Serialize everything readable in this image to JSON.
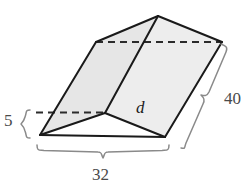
{
  "figure": {
    "kind": "geometric-solid",
    "colors": {
      "face_fill": "#e6e6e6",
      "face_fill_light": "#ededed",
      "edge_stroke": "#1a1a1a",
      "hidden_edge_stroke": "#2b2b2b",
      "brace_stroke": "#8a8a8a",
      "label_color": "#4a4a4a",
      "variable_color": "#1a1a1a",
      "background": "#ffffff"
    },
    "vertices": {
      "apex_top": [
        158,
        16
      ],
      "top_left": [
        96,
        42
      ],
      "top_right": [
        222,
        42
      ],
      "mid_front": [
        105,
        113
      ],
      "bottom_left": [
        40,
        135
      ],
      "bottom_right": [
        165,
        137
      ],
      "hidden_left": [
        40,
        113
      ]
    },
    "faces": [
      {
        "name": "left-slanted-face",
        "points": "96,42 158,16 105,113 40,135",
        "fill": "#e6e6e6"
      },
      {
        "name": "right-slanted-face",
        "points": "158,16 222,42 165,137 105,113",
        "fill": "#ededed"
      },
      {
        "name": "bottom-front-triangle",
        "points": "40,135 105,113 165,137",
        "fill": "#ffffff"
      }
    ],
    "solid_edges": [
      {
        "name": "edge-apex-to-topleft",
        "from": [
          158,
          16
        ],
        "to": [
          96,
          42
        ]
      },
      {
        "name": "edge-apex-to-topright",
        "from": [
          158,
          16
        ],
        "to": [
          222,
          42
        ]
      },
      {
        "name": "edge-apex-to-midfront",
        "from": [
          158,
          16
        ],
        "to": [
          105,
          113
        ]
      },
      {
        "name": "edge-topleft-to-bottomleft",
        "from": [
          96,
          42
        ],
        "to": [
          40,
          135
        ]
      },
      {
        "name": "edge-topright-to-bottomright",
        "from": [
          222,
          42
        ],
        "to": [
          165,
          137
        ]
      },
      {
        "name": "edge-bottomleft-to-midfront",
        "from": [
          40,
          135
        ],
        "to": [
          105,
          113
        ]
      },
      {
        "name": "edge-midfront-to-bottomright",
        "from": [
          105,
          113
        ],
        "to": [
          165,
          137
        ]
      },
      {
        "name": "edge-bottomleft-to-bottomright",
        "from": [
          40,
          135
        ],
        "to": [
          165,
          137
        ]
      }
    ],
    "hidden_edges": [
      {
        "name": "hidden-edge-top-back",
        "from": [
          96,
          42
        ],
        "to": [
          222,
          42
        ]
      },
      {
        "name": "hidden-edge-left-base",
        "from": [
          36,
          113
        ],
        "to": [
          105,
          113
        ]
      }
    ],
    "diagonal": {
      "name": "diagonal-d",
      "label": "d",
      "label_position": [
        136,
        99
      ]
    }
  },
  "dimensions": [
    {
      "id": "height-5",
      "label": "5",
      "orientation": "vertical",
      "brace_side": "left",
      "label_position": [
        4,
        112
      ],
      "span_from": [
        28,
        112
      ],
      "span_to": [
        28,
        137
      ]
    },
    {
      "id": "width-32",
      "label": "32",
      "orientation": "horizontal",
      "brace_side": "bottom",
      "label_position": [
        92,
        166
      ],
      "span_from": [
        38,
        150
      ],
      "span_to": [
        168,
        150
      ]
    },
    {
      "id": "depth-40",
      "label": "40",
      "orientation": "diagonal",
      "brace_side": "right",
      "label_position": [
        224,
        90
      ],
      "span_from": [
        228,
        47
      ],
      "span_to": [
        178,
        142
      ]
    }
  ]
}
